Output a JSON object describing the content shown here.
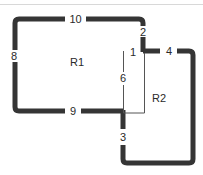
{
  "diagram": {
    "regions": [
      {
        "id": "R1",
        "label": "R1"
      },
      {
        "id": "R2",
        "label": "R2"
      }
    ],
    "edges": [
      {
        "id": "1",
        "label": "1",
        "style": "thin"
      },
      {
        "id": "2",
        "label": "2",
        "style": "thick"
      },
      {
        "id": "3",
        "label": "3",
        "style": "thick"
      },
      {
        "id": "4",
        "label": "4",
        "style": "thick"
      },
      {
        "id": "6",
        "label": "6",
        "style": "thin"
      },
      {
        "id": "8",
        "label": "8",
        "style": "thick"
      },
      {
        "id": "9",
        "label": "9",
        "style": "thick"
      },
      {
        "id": "10",
        "label": "10",
        "style": "thick"
      }
    ],
    "colors": {
      "thick_line": "#353535",
      "thin_line": "#555555",
      "label": "#2a2a2a",
      "background": "#ffffff"
    }
  }
}
